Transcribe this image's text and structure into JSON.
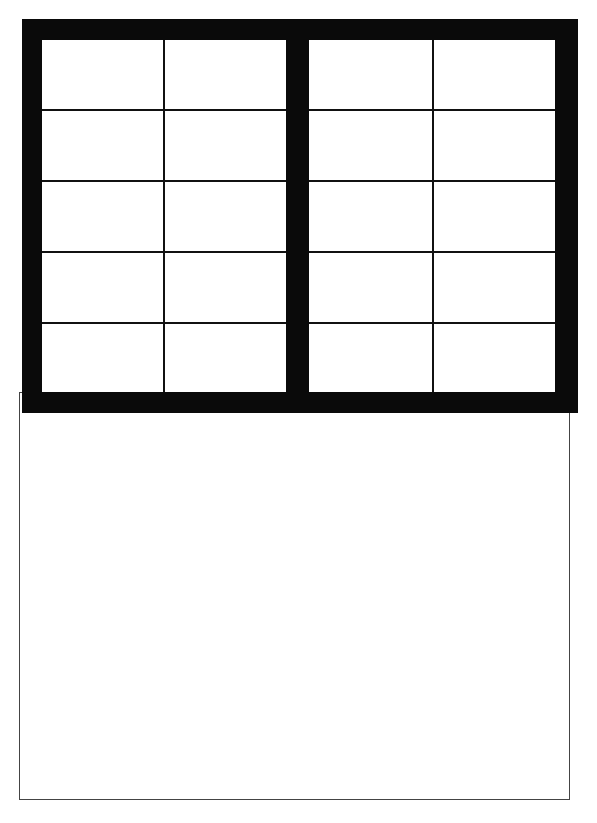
{
  "diagram": {
    "type": "window-elevation",
    "frame_color": "#0a0a0a",
    "grid_line_color": "#111111",
    "outline_color": "#444444",
    "panes": [
      {
        "name": "left-sash",
        "columns": 2,
        "rows": 5
      },
      {
        "name": "right-sash",
        "columns": 2,
        "rows": 5
      }
    ],
    "lower_panel": {
      "name": "lower-wall-panel",
      "label": ""
    }
  }
}
